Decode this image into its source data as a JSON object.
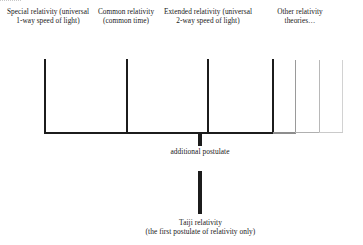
{
  "diagram": {
    "background_color": "#ffffff",
    "stroke_color": "#1c1c1c",
    "branches": [
      {
        "id": "special",
        "label": "Special relativity (universal 1-way speed of light)",
        "line_color": "#1c1c1c",
        "weight": "heavy"
      },
      {
        "id": "common",
        "label": "Common relativity (common time)",
        "line_color": "#1c1c1c",
        "weight": "heavy"
      },
      {
        "id": "extended",
        "label": "Extended relativity (universal 2-way speed of light)",
        "line_color": "#1c1c1c",
        "weight": "heavy"
      },
      {
        "id": "other",
        "label": "Other relativity theories…",
        "line_color": "#1c1c1c",
        "weight": "heavy"
      }
    ],
    "faded_branches": [
      {
        "id": "extra-1",
        "line_color": "#9a9a9a"
      },
      {
        "id": "extra-2",
        "line_color": "#b8b8b8"
      },
      {
        "id": "extra-3",
        "line_color": "#d2d2d2"
      }
    ],
    "connector_label": "additional postulate",
    "root": {
      "name": "Taiji relativity",
      "subtitle": "(the first postulate of relativity only)"
    }
  }
}
